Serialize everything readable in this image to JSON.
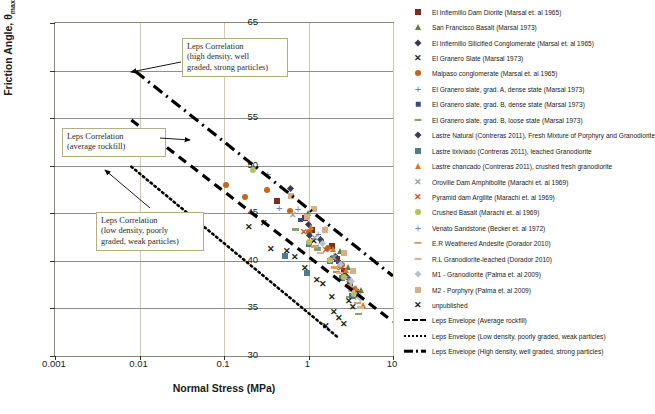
{
  "chart_data": {
    "type": "scatter",
    "title": "",
    "xlabel": "Normal Stress (MPa)",
    "ylabel": "Friction Angle, θmax",
    "xscale": "log",
    "xlim": [
      0.001,
      10
    ],
    "ylim": [
      30,
      65
    ],
    "yticks": [
      30,
      35,
      40,
      45,
      50,
      55,
      60,
      65
    ],
    "xticks": [
      "0.001",
      "0.01",
      "0.1",
      "1",
      "10"
    ],
    "grid": "vertical decade gridlines and horizontal y-tick gridlines",
    "legend_position": "right",
    "series": [
      {
        "name": "El Infiernillo Dam Diorite (Marsal et. al 1965)",
        "marker": "square",
        "color": "#7b2d1b",
        "points": [
          [
            0.9,
            44.5
          ],
          [
            1.1,
            43.2
          ],
          [
            1.9,
            41.6
          ],
          [
            2.2,
            40.2
          ],
          [
            2.6,
            38.9
          ],
          [
            3.1,
            37.8
          ],
          [
            0.42,
            46.3
          ],
          [
            3.6,
            36.7
          ]
        ]
      },
      {
        "name": "San Francisco Basalt (Marsal 1973)",
        "marker": "triangle",
        "color": "#5f7a3a",
        "points": [
          [
            1.0,
            45.0
          ],
          [
            1.6,
            43.4
          ],
          [
            2.4,
            41.0
          ],
          [
            3.0,
            39.4
          ],
          [
            4.2,
            36.9
          ]
        ]
      },
      {
        "name": "El Infiernillo Silicified Conglomerate (Marsal et. al 1965)",
        "marker": "diamond",
        "color": "#3a3a52",
        "points": [
          [
            0.62,
            47.6
          ],
          [
            1.0,
            43.8
          ],
          [
            1.4,
            42.2
          ],
          [
            2.1,
            40.4
          ],
          [
            2.9,
            38.2
          ],
          [
            3.8,
            36.4
          ]
        ]
      },
      {
        "name": "El Granero Slate (Marsal 1973)",
        "marker": "x",
        "color": "#222222",
        "points": [
          [
            0.3,
            44.0
          ],
          [
            0.55,
            41.0
          ],
          [
            0.9,
            39.2
          ],
          [
            1.5,
            37.6
          ],
          [
            2.0,
            34.6
          ],
          [
            2.6,
            33.4
          ],
          [
            3.4,
            35.2
          ],
          [
            1.15,
            42.1
          ]
        ]
      },
      {
        "name": "Malpaso conglomerate (Marsal et. al 1965)",
        "marker": "circle",
        "color": "#c4651a",
        "points": [
          [
            0.105,
            48.0
          ],
          [
            0.175,
            46.7
          ],
          [
            0.32,
            47.4
          ],
          [
            0.6,
            45.2
          ],
          [
            1.0,
            43.0
          ],
          [
            1.7,
            41.4
          ],
          [
            2.5,
            39.6
          ]
        ]
      },
      {
        "name": "El Granero slate, grad. A, dense state (Marsal 1973)",
        "marker": "plus",
        "color": "#6b7fc4",
        "points": [
          [
            0.33,
            49.1
          ],
          [
            0.75,
            45.4
          ],
          [
            1.3,
            42.8
          ],
          [
            2.0,
            40.6
          ],
          [
            2.8,
            38.4
          ],
          [
            3.6,
            36.2
          ]
        ]
      },
      {
        "name": "El Granero slate, grad. B, dense state (Marsal 1973)",
        "marker": "small-square",
        "color": "#3f4a7a",
        "points": [
          [
            0.82,
            44.2
          ],
          [
            1.45,
            41.9
          ],
          [
            2.3,
            39.8
          ],
          [
            3.2,
            37.5
          ]
        ]
      },
      {
        "name": "El Granero slate, grad. B, loose state (Marsal 1973)",
        "marker": "dash",
        "color": "#8aa06a",
        "points": [
          [
            0.7,
            43.1
          ],
          [
            1.25,
            41.0
          ],
          [
            2.1,
            38.6
          ],
          [
            3.0,
            36.0
          ],
          [
            3.9,
            34.2
          ]
        ]
      },
      {
        "name": "Lastre Natural (Contreras 2011), Fresh Mixture of Porphyry and Granodiorite",
        "marker": "diamond",
        "color": "#3a3a52",
        "points": [
          [
            1.05,
            42.6
          ],
          [
            1.9,
            40.2
          ],
          [
            2.7,
            38.5
          ],
          [
            3.5,
            36.8
          ]
        ]
      },
      {
        "name": "Lastre lixiviado (Contreras 2011), leached Granodiorite",
        "marker": "square",
        "color": "#4d7d8c",
        "points": [
          [
            0.52,
            40.5
          ],
          [
            1.0,
            41.8
          ],
          [
            1.8,
            40.0
          ],
          [
            2.5,
            38.2
          ],
          [
            3.3,
            36.3
          ],
          [
            0.95,
            38.7
          ]
        ]
      },
      {
        "name": "Lastre chancado (Contreras 2011), crushed fresh granodiorite",
        "marker": "triangle",
        "color": "#d07a2a",
        "points": [
          [
            1.1,
            43.6
          ],
          [
            1.95,
            41.2
          ],
          [
            2.8,
            39.0
          ],
          [
            3.7,
            37.1
          ],
          [
            4.5,
            35.4
          ]
        ]
      },
      {
        "name": "Oroville Dam Amphibolite (Marachi et. al 1969)",
        "marker": "x",
        "color": "#9aa0a6",
        "points": [
          [
            0.65,
            44.8
          ],
          [
            1.2,
            42.4
          ],
          [
            2.0,
            40.3
          ],
          [
            3.0,
            38.0
          ],
          [
            4.0,
            36.3
          ]
        ]
      },
      {
        "name": "Pyramid dam Argilite (Marachi et. al 1969)",
        "marker": "x",
        "color": "#c4502a",
        "points": [
          [
            0.88,
            43.0
          ],
          [
            1.6,
            41.1
          ],
          [
            2.4,
            39.2
          ],
          [
            3.4,
            37.0
          ]
        ]
      },
      {
        "name": "Crushed Basalt (Marachi et. al 1969)",
        "marker": "circle",
        "color": "#b5c15e",
        "points": [
          [
            0.22,
            49.6
          ],
          [
            1.0,
            42.0
          ],
          [
            1.8,
            40.1
          ],
          [
            2.6,
            38.3
          ],
          [
            3.5,
            36.5
          ]
        ]
      },
      {
        "name": "Venato Sandstone (Becker et. al 1972)",
        "marker": "plus",
        "color": "#6b7fc4",
        "points": [
          [
            0.45,
            45.6
          ],
          [
            1.3,
            41.5
          ],
          [
            2.2,
            39.4
          ],
          [
            3.1,
            37.4
          ]
        ]
      },
      {
        "name": "E.R Weathered Andesite (Dorador 2010)",
        "marker": "dash",
        "color": "#d9a066",
        "points": [
          [
            1.15,
            41.3
          ],
          [
            2.0,
            39.1
          ],
          [
            2.9,
            37.2
          ],
          [
            3.8,
            35.4
          ]
        ]
      },
      {
        "name": "R.L Granodiorite-leached (Dorador 2010)",
        "marker": "dash",
        "color": "#e2b08a",
        "points": [
          [
            1.35,
            40.6
          ],
          [
            2.3,
            38.5
          ],
          [
            3.2,
            36.6
          ],
          [
            4.1,
            34.9
          ]
        ]
      },
      {
        "name": "M1 - Granodiorite (Palma et. al 2009)",
        "marker": "diamond",
        "color": "#b9c2cc",
        "points": [
          [
            1.5,
            41.8
          ],
          [
            2.4,
            39.6
          ],
          [
            3.3,
            37.8
          ],
          [
            4.2,
            36.0
          ]
        ]
      },
      {
        "name": "M2 - Porphyry (Palma et. al 2009)",
        "marker": "square",
        "color": "#d4b08a",
        "points": [
          [
            0.62,
            46.8
          ],
          [
            0.95,
            44.6
          ],
          [
            1.15,
            45.4
          ],
          [
            1.55,
            43.2
          ],
          [
            2.6,
            40.8
          ],
          [
            3.4,
            38.9
          ]
        ]
      },
      {
        "name": "unpublished",
        "marker": "x",
        "color": "#222222",
        "points": [
          [
            0.2,
            43.6
          ],
          [
            0.36,
            41.2
          ],
          [
            0.7,
            40.4
          ],
          [
            1.25,
            38.0
          ],
          [
            1.9,
            36.2
          ],
          [
            2.3,
            34.0
          ],
          [
            3.0,
            35.8
          ],
          [
            1.6,
            33.2
          ]
        ]
      }
    ],
    "envelopes": [
      {
        "name": "Leps Envelope (Average rockfill)",
        "style": "dashed",
        "points": [
          [
            0.008,
            54.8
          ],
          [
            10,
            33.6
          ]
        ]
      },
      {
        "name": "Leps Envelope (Low density, poorly graded, weak particles)",
        "style": "dotted",
        "points": [
          [
            0.008,
            49.9
          ],
          [
            2.2,
            32.0
          ]
        ]
      },
      {
        "name": "Leps Envelope (High density, well graded, strong particles)",
        "style": "dash-dot",
        "points": [
          [
            0.009,
            59.9
          ],
          [
            10,
            38.4
          ]
        ]
      }
    ],
    "annotations": [
      {
        "id": "note-high",
        "text_lines": [
          "Leps Correlation",
          "(high density, well",
          "graded, strong particles)"
        ]
      },
      {
        "id": "note-avg",
        "text_lines": [
          "Leps Correlation",
          "(average rockfill)"
        ]
      },
      {
        "id": "note-low",
        "text_lines": [
          "Leps Correlation",
          "(low density, poorly",
          "graded, weak particles)"
        ]
      }
    ]
  },
  "legend": {
    "items": [
      {
        "label": "El Infiernillo Dam Diorite (Marsal et. al 1965)",
        "marker": "square",
        "color": "#7b2d1b"
      },
      {
        "label": "San Francisco Basalt (Marsal 1973)",
        "marker": "triangle",
        "color": "#5f7a3a"
      },
      {
        "label": "El Infiernillo Silicified Conglomerate (Marsal et. al 1965)",
        "marker": "diamond",
        "color": "#3a3a52"
      },
      {
        "label": "El Granero Slate (Marsal 1973)",
        "marker": "x",
        "color": "#222222"
      },
      {
        "label": "Malpaso conglomerate (Marsal et. al 1965)",
        "marker": "circle",
        "color": "#c4651a"
      },
      {
        "label": "El Granero slate, grad. A, dense state (Marsal 1973)",
        "marker": "plus",
        "color": "#6b7fc4"
      },
      {
        "label": "El Granero slate, grad. B, dense state (Marsal 1973)",
        "marker": "small-square",
        "color": "#3f4a7a"
      },
      {
        "label": "El Granero slate, grad. B, loose state (Marsal 1973)",
        "marker": "dash",
        "color": "#8aa06a"
      },
      {
        "label": "Lastre Natural (Contreras 2011), Fresh Mixture of Porphyry and Granodiorite",
        "marker": "diamond",
        "color": "#3a3a52"
      },
      {
        "label": "Lastre lixiviado (Contreras 2011), leached Granodiorite",
        "marker": "square",
        "color": "#4d7d8c"
      },
      {
        "label": "Lastre chancado (Contreras 2011), crushed fresh granodiorite",
        "marker": "triangle",
        "color": "#d07a2a"
      },
      {
        "label": "Oroville Dam Amphibolite (Marachi et. al 1969)",
        "marker": "x",
        "color": "#9aa0a6"
      },
      {
        "label": "Pyramid dam Argilite (Marachi et. al 1969)",
        "marker": "x",
        "color": "#c4502a"
      },
      {
        "label": "Crushed Basalt (Marachi et. al 1969)",
        "marker": "circle",
        "color": "#b5c15e"
      },
      {
        "label": "Venato Sandstone (Becker et. al 1972)",
        "marker": "plus",
        "color": "#6b7fc4"
      },
      {
        "label": "E.R Weathered Andesite (Dorador 2010)",
        "marker": "dash",
        "color": "#d9a066"
      },
      {
        "label": "R.L Granodiorite-leached (Dorador 2010)",
        "marker": "dash",
        "color": "#e2b08a"
      },
      {
        "label": "M1 - Granodiorite (Palma et. al 2009)",
        "marker": "diamond",
        "color": "#b9c2cc"
      },
      {
        "label": "M2 - Porphyry (Palma et. al 2009)",
        "marker": "square",
        "color": "#d4b08a"
      },
      {
        "label": "unpublished",
        "marker": "x",
        "color": "#222222"
      },
      {
        "label": "Leps Envelope (Average rockfill)",
        "marker": "line-dashed",
        "color": "#000000"
      },
      {
        "label": "Leps Envelope (Low density, poorly graded, weak particles)",
        "marker": "line-dotted",
        "color": "#000000"
      },
      {
        "label": "Leps Envelope (High density, well graded, strong particles)",
        "marker": "line-dashdot",
        "color": "#000000"
      }
    ]
  }
}
